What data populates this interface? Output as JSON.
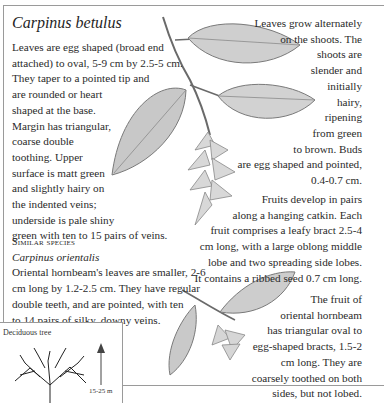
{
  "species": {
    "title": "Carpinus betulus"
  },
  "leaf_description": {
    "lines": [
      "Leaves are egg shaped (broad end",
      "attached) to oval, 5-9 cm by 2.5-5 cm.",
      "They taper to a pointed tip and",
      "are rounded or heart",
      "shaped at the base.",
      "Margin has triangular,",
      "coarse double",
      "toothing. Upper",
      "surface is matt green",
      "and slightly hairy on",
      "the indented veins;",
      "underside is pale shiny",
      "green with ten to 15 pairs of veins."
    ]
  },
  "shoots_description": {
    "lines": [
      "Leaves grow alternately",
      "on the shoots. The",
      "shoots are",
      "slender and",
      "initially",
      "hairy,",
      "ripening",
      "from green",
      "to brown. Buds",
      "are egg shaped and pointed,",
      "0.4-0.7 cm."
    ]
  },
  "fruits_description": {
    "lines": [
      "Fruits develop in pairs",
      "along a hanging catkin. Each",
      "fruit comprises a leafy bract 2.5-4",
      "cm long, with a large oblong middle",
      "lobe and two spreading side lobes.",
      "It contains a ribbed seed 0.7 cm long."
    ]
  },
  "similar_species": {
    "heading": "Similar species",
    "name": "Carpinus orientalis",
    "lines": [
      "Oriental hornbeam's leaves are smaller, 2-6",
      "cm long by 1.2-2.5 cm. They have regular",
      "double teeth, and are pointed, with ten",
      "to 14 pairs of silky, downy veins."
    ]
  },
  "oriental_fruit_description": {
    "lines": [
      "The fruit of",
      "oriental hornbeam",
      "has triangular oval to",
      "egg-shaped bracts, 1.5-2",
      "cm long. They are",
      "coarsely toothed on both",
      "sides, but not lobed."
    ]
  },
  "tree_inset": {
    "label": "Deciduous tree",
    "height": "15-25 m",
    "icon": "tree-silhouette"
  },
  "colors": {
    "text": "#2a2a2a",
    "frame": "#9a9a9a",
    "illustration": "#6e6e6e"
  }
}
